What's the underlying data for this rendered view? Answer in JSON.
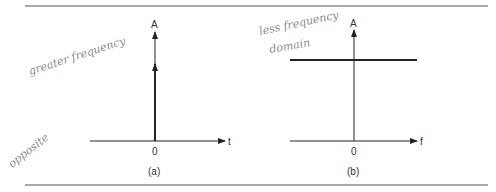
{
  "figure": {
    "panel_a": {
      "caption": "(a)",
      "y_axis_label": "A",
      "x_axis_label": "t",
      "origin_label": "0",
      "description": "impulse at t=0"
    },
    "panel_b": {
      "caption": "(b)",
      "y_axis_label": "A",
      "x_axis_label": "f",
      "origin_label": "0",
      "description": "constant amplitude across all frequencies"
    },
    "annotations": {
      "handwritten_a_top": "greater frequency",
      "handwritten_a_bottom": "opposite",
      "handwritten_b_line1": "less frequency",
      "handwritten_b_line2": "domain"
    },
    "colors": {
      "ink": "#222222",
      "rule": "#555555",
      "pencil": "#8a8a8a"
    }
  }
}
